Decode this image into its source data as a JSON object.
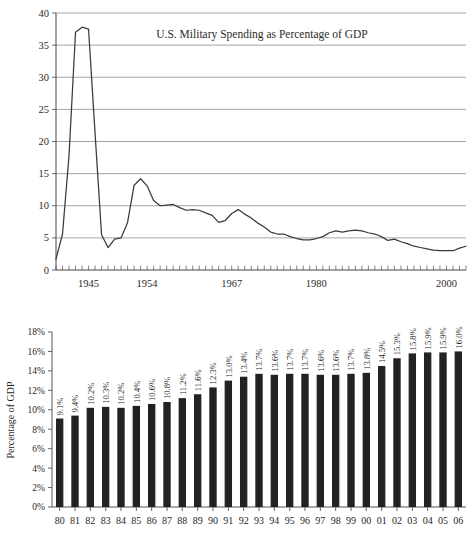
{
  "page": {
    "background_color": "#ffffff",
    "ink_color": "#222222"
  },
  "chart_data": [
    {
      "id": "line-chart",
      "type": "line",
      "title": "U.S. Military Spending as Percentage of GDP",
      "xlabel": "",
      "ylabel": "",
      "ylim": [
        0,
        40
      ],
      "yticks": [
        "0",
        "5",
        "10",
        "15",
        "20",
        "25",
        "30",
        "35",
        "40"
      ],
      "ytick_values": [
        0,
        5,
        10,
        15,
        20,
        25,
        30,
        35,
        40
      ],
      "xlim": [
        1940,
        2003
      ],
      "xticks": [
        "1945",
        "1954",
        "1967",
        "1980",
        "2000"
      ],
      "xtick_values": [
        1945,
        1954,
        1967,
        1980,
        2000
      ],
      "grid": "horizontal",
      "minor_tick_interval": 1,
      "legend": "none",
      "series": [
        {
          "name": "U.S. Military Spending as Percentage of GDP",
          "color": "#3a3a3a",
          "x": [
            1940,
            1941,
            1942,
            1943,
            1944,
            1945,
            1946,
            1947,
            1948,
            1949,
            1950,
            1951,
            1952,
            1953,
            1954,
            1955,
            1956,
            1957,
            1958,
            1959,
            1960,
            1961,
            1962,
            1963,
            1964,
            1965,
            1966,
            1967,
            1968,
            1969,
            1970,
            1971,
            1972,
            1973,
            1974,
            1975,
            1976,
            1977,
            1978,
            1979,
            1980,
            1981,
            1982,
            1983,
            1984,
            1985,
            1986,
            1987,
            1988,
            1989,
            1990,
            1991,
            1992,
            1993,
            1994,
            1995,
            1996,
            1997,
            1998,
            1999,
            2000,
            2001,
            2002,
            2003
          ],
          "y": [
            1.7,
            5.6,
            17.8,
            37.0,
            37.8,
            37.5,
            21.3,
            5.5,
            3.5,
            4.8,
            5.0,
            7.4,
            13.2,
            14.2,
            13.1,
            10.8,
            10.0,
            10.1,
            10.2,
            9.7,
            9.3,
            9.4,
            9.3,
            8.9,
            8.5,
            7.4,
            7.7,
            8.8,
            9.4,
            8.7,
            8.1,
            7.3,
            6.7,
            5.9,
            5.6,
            5.6,
            5.2,
            4.9,
            4.7,
            4.7,
            4.9,
            5.2,
            5.8,
            6.1,
            5.9,
            6.1,
            6.2,
            6.1,
            5.8,
            5.6,
            5.2,
            4.6,
            4.8,
            4.4,
            4.1,
            3.7,
            3.5,
            3.3,
            3.1,
            3.0,
            3.0,
            3.0,
            3.4,
            3.7
          ]
        }
      ]
    },
    {
      "id": "bar-chart",
      "type": "bar",
      "title": "",
      "xlabel": "",
      "ylabel": "Percentage of GDP",
      "ylim": [
        0,
        18
      ],
      "yticks": [
        "0%",
        "2%",
        "4%",
        "6%",
        "8%",
        "10%",
        "12%",
        "14%",
        "16%",
        "18%"
      ],
      "ytick_values": [
        0,
        2,
        4,
        6,
        8,
        10,
        12,
        14,
        16,
        18
      ],
      "grid": "none",
      "legend": "none",
      "bar_color": "#222222",
      "categories": [
        "80",
        "81",
        "82",
        "83",
        "84",
        "85",
        "86",
        "87",
        "88",
        "89",
        "90",
        "91",
        "92",
        "93",
        "94",
        "95",
        "96",
        "97",
        "98",
        "99",
        "00",
        "01",
        "02",
        "03",
        "04",
        "05",
        "06"
      ],
      "values": [
        9.1,
        9.4,
        10.2,
        10.3,
        10.2,
        10.4,
        10.6,
        10.8,
        11.2,
        11.6,
        12.3,
        13.0,
        13.4,
        13.7,
        13.6,
        13.7,
        13.7,
        13.6,
        13.6,
        13.7,
        13.8,
        14.5,
        15.3,
        15.8,
        15.9,
        15.9,
        16.0
      ],
      "value_labels": [
        "9.1%",
        "9.4%",
        "10.2%",
        "10.3%",
        "10.2%",
        "10.4%",
        "10.6%",
        "10.8%",
        "11.2%",
        "11.6%",
        "12.3%",
        "13.0%",
        "13.4%",
        "13.7%",
        "13.6%",
        "13.7%",
        "13.7%",
        "13.6%",
        "13.6%",
        "13.7%",
        "13.8%",
        "14.5%",
        "15.3%",
        "15.8%",
        "15.9%",
        "15.9%",
        "16.0%"
      ],
      "value_label_rotation": -90
    }
  ]
}
